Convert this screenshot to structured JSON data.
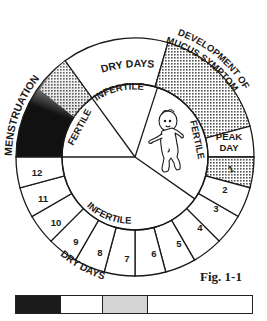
{
  "figure": {
    "caption": "Fig. 1-1",
    "outer_labels": {
      "menstruation": "MENSTRUATION",
      "dry_days_top": "DRY DAYS",
      "mucus": [
        "DEVELOPMENT OF",
        "MUCUS SYMPTOM"
      ],
      "dry_days_bottom": "DRY DAYS"
    },
    "inner_labels": {
      "fertile_left": "FERTILE",
      "infertile_top": "INFERTILE",
      "fertile_right": "FERTILE",
      "infertile_bottom": "INFERTILE"
    },
    "peak_day": [
      "PEAK",
      "DAY"
    ],
    "post_peak_days": [
      "1",
      "2",
      "3",
      "4",
      "5",
      "6",
      "7",
      "8",
      "9",
      "10",
      "11",
      "12"
    ],
    "center_illustration": "baby-figure"
  },
  "legend_bar": {
    "segments": [
      {
        "name": "menstruation",
        "color": "#1c1c1c",
        "width_px": 45
      },
      {
        "name": "dry-days",
        "color": "#ffffff",
        "width_px": 42
      },
      {
        "name": "mucus",
        "color": "#d4d4d4",
        "width_px": 45
      },
      {
        "name": "post-peak",
        "color": "#ffffff",
        "width_px": 106
      }
    ]
  },
  "colors": {
    "ink": "#1a1a1a",
    "menstruation": "#1c1c1c",
    "dotted_fill": "#bdbdbd",
    "legend_gray": "#d4d4d4"
  }
}
